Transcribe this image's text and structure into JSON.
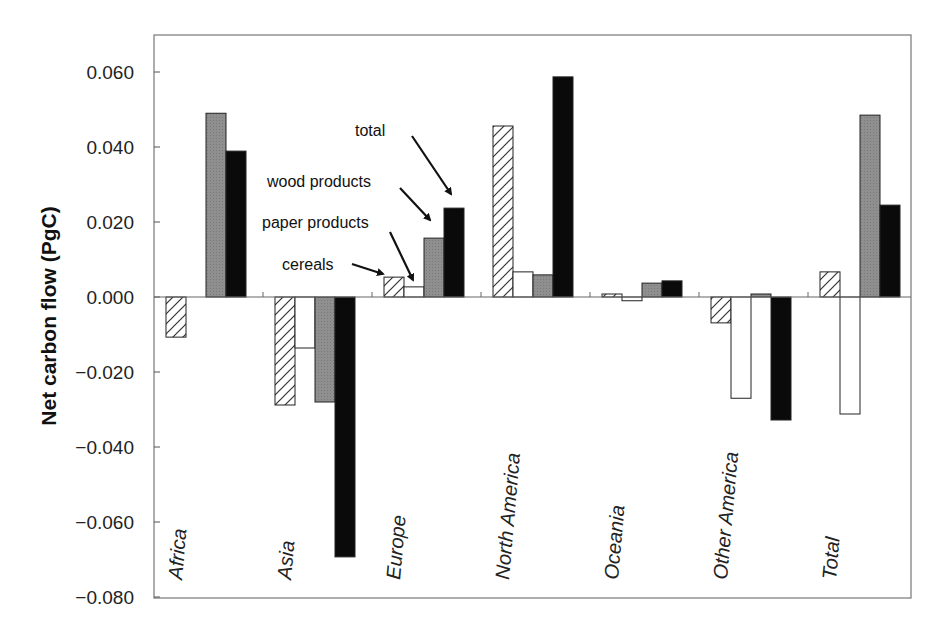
{
  "chart_data": {
    "type": "bar",
    "title": "",
    "xlabel": "",
    "ylabel": "Net carbon flow (PgC)",
    "ylim": [
      -0.08,
      0.07
    ],
    "yticks": [
      -0.08,
      -0.06,
      -0.04,
      -0.02,
      0.0,
      0.02,
      0.04,
      0.06
    ],
    "ytick_labels": [
      "-0.080",
      "-0.060",
      "-0.040",
      "-0.020",
      "0.000",
      "0.020",
      "0.040",
      "0.060"
    ],
    "grid": false,
    "legend_position": "annotations with arrows on Europe group",
    "categories": [
      "Africa",
      "Asia",
      "Europe",
      "North America",
      "Oceania",
      "Other America",
      "Total"
    ],
    "series": [
      {
        "name": "cereals",
        "style": "hatched",
        "fill": "#ffffff",
        "values": [
          -0.0107,
          -0.0288,
          0.0053,
          0.0456,
          0.0008,
          -0.0069,
          0.0067
        ]
      },
      {
        "name": "paper products",
        "style": "open",
        "fill": "#ffffff",
        "values": [
          0.0,
          -0.0136,
          0.0027,
          0.0067,
          -0.001,
          -0.027,
          -0.0312
        ]
      },
      {
        "name": "wood products",
        "style": "grey",
        "fill": "#8c8c8c",
        "values": [
          0.049,
          -0.028,
          0.0157,
          0.0059,
          0.0037,
          0.0008,
          0.0485
        ]
      },
      {
        "name": "total",
        "style": "black",
        "fill": "#0a0a0a",
        "values": [
          0.0389,
          -0.0693,
          0.0237,
          0.0587,
          0.0043,
          -0.0328,
          0.0245
        ]
      }
    ],
    "annotations": [
      {
        "text": "total",
        "x": 355,
        "y": 136,
        "arrow": [
          412,
          136,
          451,
          194
        ]
      },
      {
        "text": "wood products",
        "x": 267,
        "y": 187,
        "arrow": [
          400,
          188,
          430,
          220
        ]
      },
      {
        "text": "paper products",
        "x": 262,
        "y": 228,
        "arrow": [
          390,
          232,
          413,
          280
        ]
      },
      {
        "text": "cereals",
        "x": 282,
        "y": 270,
        "arrow": [
          352,
          264,
          383,
          274
        ]
      }
    ]
  },
  "layout": {
    "plot": {
      "left": 154,
      "top": 35,
      "right": 911,
      "bottom": 598
    },
    "y_zero_px": 297,
    "px_per_unit": 3750,
    "group_width": 109,
    "bar_width": 20,
    "bar_offset": 12
  }
}
